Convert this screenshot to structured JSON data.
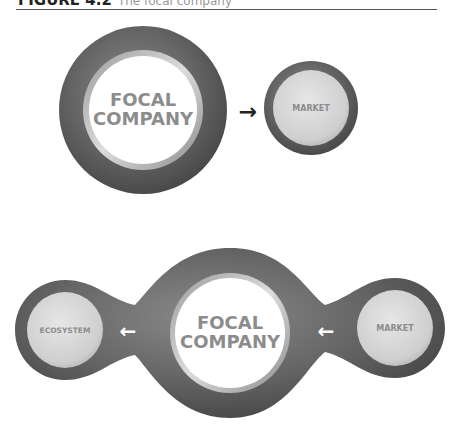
{
  "figure": {
    "title": "FIGURE 4.2",
    "subtitle": "The focal company"
  },
  "top_diagram": {
    "focal_line1": "FOCAL",
    "focal_line2": "COMPANY",
    "market": "MARKET",
    "arrow": "→"
  },
  "bottom_diagram": {
    "ecosystem": "ECOSYSTEM",
    "focal_line1": "FOCAL",
    "focal_line2": "COMPANY",
    "market": "MARKET",
    "arrow_left": "←",
    "arrow_right": "←"
  },
  "colors": {
    "ring": "#5a5a5a",
    "inner": "#d6d6d6",
    "focal_inner": "#ffffff",
    "label": "#8c8c8c"
  }
}
